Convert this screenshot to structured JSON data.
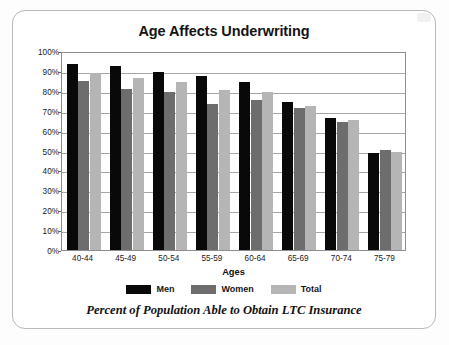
{
  "figure": {
    "title": "Age Affects Underwriting",
    "caption": "Percent of Population Able to Obtain LTC Insurance",
    "x_axis_title": "Ages",
    "frame_border_color": "#b9b9b9",
    "background_color": "#ffffff"
  },
  "legend": {
    "position": "bottom",
    "items": [
      {
        "label": "Men",
        "color": "#090909"
      },
      {
        "label": "Women",
        "color": "#6d6d6d"
      },
      {
        "label": "Total",
        "color": "#b5b5b5"
      }
    ]
  },
  "y_axis": {
    "ticks": [
      "0%",
      "10%",
      "20%",
      "30%",
      "40%",
      "50%",
      "60%",
      "70%",
      "80%",
      "90%",
      "100%"
    ],
    "min": 0,
    "max": 100
  },
  "chart_data": {
    "type": "bar",
    "title": "Age Affects Underwriting",
    "subtitle": "Percent of Population Able to Obtain LTC Insurance",
    "xlabel": "Ages",
    "ylabel": "",
    "ylim": [
      0,
      100
    ],
    "ytick_values": [
      0,
      10,
      20,
      30,
      40,
      50,
      60,
      70,
      80,
      90,
      100
    ],
    "ytick_labels": [
      "0%",
      "10%",
      "20%",
      "30%",
      "40%",
      "50%",
      "60%",
      "70%",
      "80%",
      "90%",
      "100%"
    ],
    "grid": true,
    "grid_axis": "y",
    "legend_position": "bottom",
    "categories": [
      "40-44",
      "45-49",
      "50-54",
      "55-59",
      "60-64",
      "65-69",
      "70-74",
      "75-79"
    ],
    "series": [
      {
        "name": "Men",
        "color": "#090909",
        "values": [
          93.5,
          92.5,
          89.5,
          87.5,
          84.5,
          74.5,
          66.5,
          49.0
        ]
      },
      {
        "name": "Women",
        "color": "#6d6d6d",
        "values": [
          85.0,
          81.0,
          79.5,
          73.5,
          75.5,
          71.5,
          64.5,
          50.5
        ]
      },
      {
        "name": "Total",
        "color": "#b5b5b5",
        "values": [
          89.0,
          86.5,
          84.5,
          80.5,
          79.5,
          72.5,
          65.5,
          49.5
        ]
      }
    ]
  }
}
